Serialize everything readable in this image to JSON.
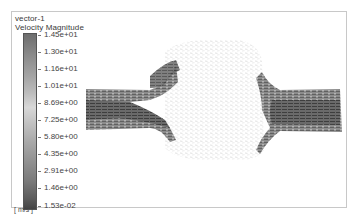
{
  "legend": {
    "title": "vector-1",
    "subtitle": "Velocity Magnitude",
    "units": "[ m/s ]",
    "labels": [
      "1.45e+01",
      "1.30e+01",
      "1.16e+01",
      "1.01e+01",
      "8.69e+00",
      "7.25e+00",
      "5.80e+00",
      "4.35e+00",
      "2.91e+00",
      "1.46e+00",
      "1.53e-02"
    ]
  },
  "colors": {
    "frame": "#c8c8c8",
    "vector_dark": "#4a4a4a",
    "vector_light": "#c8c8c8"
  }
}
